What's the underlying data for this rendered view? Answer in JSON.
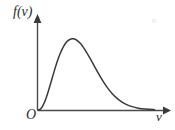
{
  "figure": {
    "background_color": "#ffffff",
    "curve_color": "#3a3a3a",
    "axis_color": "#4a4a4a",
    "label_color": "#2b2b2b",
    "y_axis_label": "f(v)",
    "x_axis_label": "v",
    "origin_label": "O"
  },
  "chart_data": {
    "type": "line",
    "title": "",
    "subtitle": "",
    "xlabel": "v",
    "ylabel": "f(v)",
    "grid": false,
    "legend": false,
    "legend_position": "none",
    "xlim": [
      0,
      5
    ],
    "ylim": [
      0,
      1.05
    ],
    "x_tick_labels": [],
    "y_tick_labels": [],
    "annotations": [
      "O"
    ],
    "series": [
      {
        "name": "Maxwell-Boltzmann speed distribution",
        "x": [
          0.0,
          0.1,
          0.2,
          0.3,
          0.4,
          0.5,
          0.6,
          0.7,
          0.8,
          0.9,
          1.0,
          1.1,
          1.2,
          1.3,
          1.4,
          1.5,
          1.6,
          1.7,
          1.8,
          1.9,
          2.0,
          2.2,
          2.4,
          2.6,
          2.8,
          3.0,
          3.2,
          3.4,
          3.6,
          3.8,
          4.0,
          4.3,
          4.6,
          5.0
        ],
        "y": [
          0.0,
          0.015,
          0.057,
          0.121,
          0.203,
          0.295,
          0.391,
          0.485,
          0.572,
          0.65,
          0.715,
          0.768,
          0.808,
          0.834,
          0.848,
          0.85,
          0.841,
          0.822,
          0.795,
          0.761,
          0.721,
          0.628,
          0.527,
          0.427,
          0.335,
          0.255,
          0.188,
          0.135,
          0.094,
          0.064,
          0.043,
          0.022,
          0.011,
          0.004
        ]
      }
    ],
    "peak": {
      "x": 1.5,
      "y": 0.85
    }
  }
}
